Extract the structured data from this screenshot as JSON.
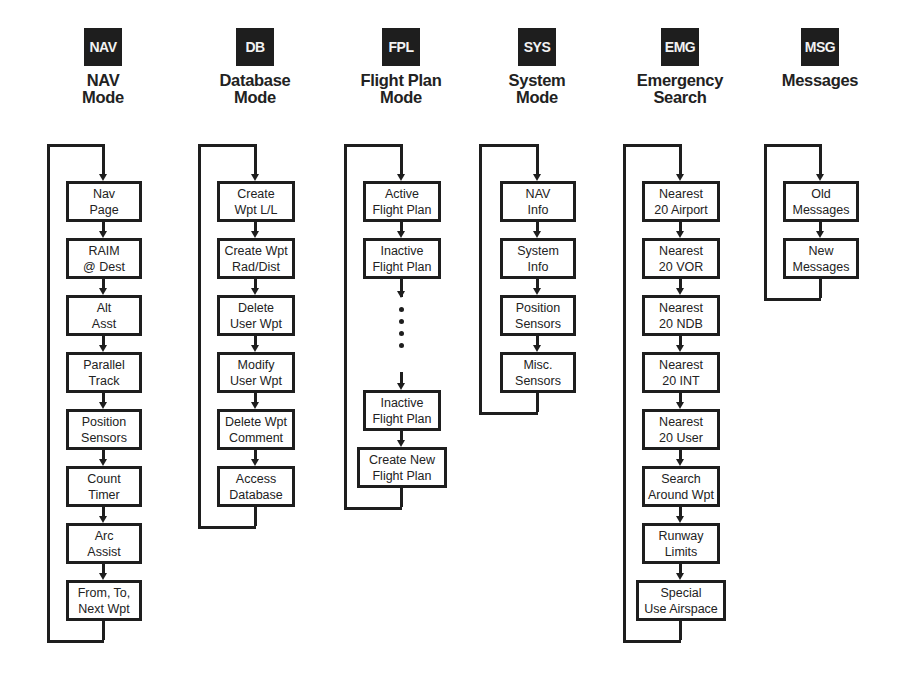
{
  "modes": [
    {
      "key": "NAV",
      "title": "NAV\nMode",
      "items": [
        "Nav\nPage",
        "RAIM\n@ Dest",
        "Alt\nAsst",
        "Parallel\nTrack",
        "Position\nSensors",
        "Count\nTimer",
        "Arc\nAssist",
        "From, To,\nNext Wpt"
      ]
    },
    {
      "key": "DB",
      "title": "Database\nMode",
      "items": [
        "Create\nWpt L/L",
        "Create Wpt\nRad/Dist",
        "Delete\nUser Wpt",
        "Modify\nUser Wpt",
        "Delete Wpt\nComment",
        "Access\nDatabase"
      ]
    },
    {
      "key": "FPL",
      "title": "Flight Plan\nMode",
      "items": [
        "Active\nFlight Plan",
        "Inactive\nFlight Plan",
        "Inactive\nFlight Plan",
        "Create New\nFlight Plan"
      ],
      "ellipsis_after_index": 1
    },
    {
      "key": "SYS",
      "title": "System\nMode",
      "items": [
        "NAV\nInfo",
        "System\nInfo",
        "Position\nSensors",
        "Misc.\nSensors"
      ]
    },
    {
      "key": "EMG",
      "title": "Emergency\nSearch",
      "items": [
        "Nearest\n20 Airport",
        "Nearest\n20 VOR",
        "Nearest\n20 NDB",
        "Nearest\n20 INT",
        "Nearest\n20 User",
        "Search\nAround Wpt",
        "Runway\nLimits",
        "Special\nUse Airspace"
      ]
    },
    {
      "key": "MSG",
      "title": "Messages",
      "items": [
        "Old\nMessages",
        "New\nMessages"
      ]
    }
  ],
  "colors": {
    "ink": "#1e1e1e",
    "key_text": "#f2f2f2",
    "background": "#ffffff"
  }
}
